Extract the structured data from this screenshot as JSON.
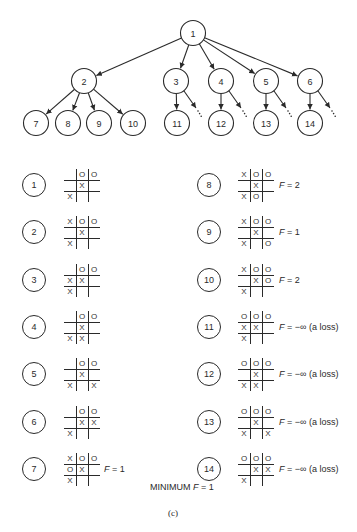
{
  "tree": {
    "nodes": [
      {
        "id": "1",
        "x": 193,
        "y": 33
      },
      {
        "id": "2",
        "x": 84,
        "y": 81
      },
      {
        "id": "3",
        "x": 176,
        "y": 81
      },
      {
        "id": "4",
        "x": 221,
        "y": 81
      },
      {
        "id": "5",
        "x": 266,
        "y": 81
      },
      {
        "id": "6",
        "x": 310,
        "y": 81
      },
      {
        "id": "7",
        "x": 36,
        "y": 123
      },
      {
        "id": "8",
        "x": 68,
        "y": 123
      },
      {
        "id": "9",
        "x": 99,
        "y": 123
      },
      {
        "id": "10",
        "x": 133,
        "y": 123
      },
      {
        "id": "11",
        "x": 177,
        "y": 123
      },
      {
        "id": "12",
        "x": 221,
        "y": 123
      },
      {
        "id": "13",
        "x": 266,
        "y": 123
      },
      {
        "id": "14",
        "x": 310,
        "y": 123
      }
    ],
    "edges": [
      [
        "1",
        "2"
      ],
      [
        "1",
        "3"
      ],
      [
        "1",
        "4"
      ],
      [
        "1",
        "5"
      ],
      [
        "1",
        "6"
      ],
      [
        "2",
        "7"
      ],
      [
        "2",
        "8"
      ],
      [
        "2",
        "9"
      ],
      [
        "2",
        "10"
      ],
      [
        "3",
        "11"
      ],
      [
        "4",
        "12"
      ],
      [
        "5",
        "13"
      ],
      [
        "6",
        "14"
      ]
    ],
    "ellipsis_from": [
      "3",
      "4",
      "5",
      "6"
    ]
  },
  "states": [
    {
      "id": "1",
      "board": [
        "",
        "O",
        "O",
        "",
        "X",
        "",
        "X",
        "",
        ""
      ],
      "f": ""
    },
    {
      "id": "2",
      "board": [
        "X",
        "O",
        "O",
        "",
        "X",
        "",
        "X",
        "",
        ""
      ],
      "f": ""
    },
    {
      "id": "3",
      "board": [
        "",
        "O",
        "O",
        "X",
        "X",
        "",
        "X",
        "",
        ""
      ],
      "f": ""
    },
    {
      "id": "4",
      "board": [
        "",
        "O",
        "O",
        "",
        "X",
        "",
        "X",
        "X",
        ""
      ],
      "f": ""
    },
    {
      "id": "5",
      "board": [
        "",
        "O",
        "O",
        "",
        "X",
        "",
        "X",
        "",
        "X"
      ],
      "f": ""
    },
    {
      "id": "6",
      "board": [
        "",
        "O",
        "O",
        "",
        "X",
        "X",
        "X",
        "",
        ""
      ],
      "f": ""
    },
    {
      "id": "7",
      "board": [
        "X",
        "O",
        "O",
        "O",
        "X",
        "",
        "X",
        "",
        ""
      ],
      "f": "1"
    },
    {
      "id": "8",
      "board": [
        "X",
        "O",
        "O",
        "",
        "X",
        "",
        "X",
        "O",
        ""
      ],
      "f": "2"
    },
    {
      "id": "9",
      "board": [
        "X",
        "O",
        "O",
        "",
        "X",
        "",
        "X",
        "",
        "O"
      ],
      "f": "1"
    },
    {
      "id": "10",
      "board": [
        "X",
        "O",
        "O",
        "",
        "X",
        "O",
        "X",
        "",
        ""
      ],
      "f": "2"
    },
    {
      "id": "11",
      "board": [
        "O",
        "O",
        "O",
        "X",
        "X",
        "",
        "X",
        "",
        ""
      ],
      "f": "−∞ (a loss)"
    },
    {
      "id": "12",
      "board": [
        "O",
        "O",
        "O",
        "",
        "X",
        "",
        "X",
        "X",
        ""
      ],
      "f": "−∞ (a loss)"
    },
    {
      "id": "13",
      "board": [
        "O",
        "O",
        "O",
        "",
        "X",
        "",
        "X",
        "",
        "X"
      ],
      "f": "−∞ (a loss)"
    },
    {
      "id": "14",
      "board": [
        "O",
        "O",
        "O",
        "",
        "X",
        "X",
        "X",
        "",
        ""
      ],
      "f": "−∞ (a loss)"
    }
  ],
  "labels": {
    "f_prefix": "F",
    "equals": " = ",
    "summary_prefix": "MINIMUM ",
    "summary_value": "1",
    "caption": "(c)"
  }
}
